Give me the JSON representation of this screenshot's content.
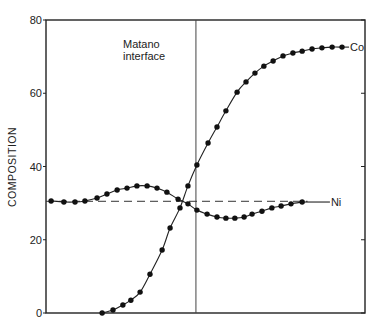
{
  "chart_data": {
    "type": "line",
    "title": "",
    "xlabel": "",
    "ylabel": "COMPOSITION",
    "xlim": [
      0,
      100
    ],
    "ylim": [
      0,
      80
    ],
    "yticks": [
      0,
      20,
      40,
      60,
      80
    ],
    "grid": false,
    "annotations": {
      "matano_label": [
        "Matano",
        "interface"
      ],
      "matano_x": 47
    },
    "reference_lines": [
      {
        "name": "Ni initial level",
        "y": 30.5,
        "style": "dashed",
        "x_range": [
          0,
          100
        ]
      }
    ],
    "series": [
      {
        "name": "Co",
        "label": "Co",
        "x": [
          17.6,
          21.0,
          24.1,
          26.6,
          29.5,
          32.6,
          36.4,
          38.9,
          42.0,
          44.5,
          47.3,
          50.8,
          53.6,
          56.4,
          59.9,
          62.7,
          65.5,
          68.3,
          71.2,
          74.3,
          77.4,
          80.3,
          83.4,
          86.5,
          89.7,
          92.8
        ],
        "y": [
          0,
          0.8,
          2.2,
          3.5,
          5.7,
          10.6,
          17.2,
          23.2,
          28.7,
          34.7,
          40.4,
          46.4,
          50.8,
          55.2,
          60.3,
          63.1,
          65.5,
          67.4,
          68.8,
          70.2,
          71.0,
          71.5,
          72.1,
          72.4,
          72.6,
          72.6
        ],
        "line_end_x": 95
      },
      {
        "name": "Ni",
        "label": "Ni",
        "x": [
          1.6,
          5.6,
          9.1,
          12.2,
          16.0,
          19.1,
          22.3,
          25.4,
          28.5,
          31.7,
          34.8,
          37.9,
          41.4,
          44.5,
          47.3,
          50.5,
          53.6,
          56.4,
          59.2,
          62.1,
          64.6,
          67.7,
          70.8,
          73.7,
          76.8,
          80.3
        ],
        "y": [
          30.6,
          30.3,
          30.3,
          30.6,
          31.4,
          32.5,
          33.6,
          34.1,
          34.7,
          34.7,
          34.1,
          33.0,
          31.1,
          29.8,
          28.1,
          27.0,
          26.2,
          25.9,
          25.9,
          26.2,
          27.0,
          27.8,
          28.7,
          29.2,
          29.8,
          30.3
        ],
        "line_end_x": 89
      }
    ]
  }
}
